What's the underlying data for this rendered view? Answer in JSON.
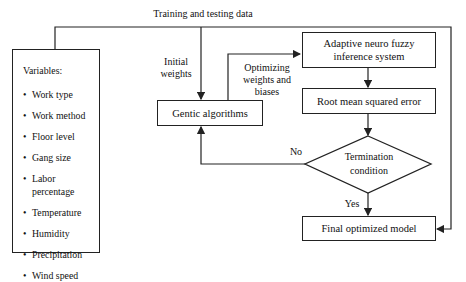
{
  "edges": {
    "training_testing_data": "Training and testing data",
    "initial_weights_line1": "Initial",
    "initial_weights_line2": "weights",
    "optimizing_line1": "Optimizing",
    "optimizing_line2": "weights and biases",
    "no": "No",
    "yes": "Yes"
  },
  "variables": {
    "title": "Variables:",
    "bullet": "•",
    "items": [
      "Work type",
      "Work method",
      "Floor level",
      "Gang size",
      "Labor",
      "percentage",
      "Temperature",
      "Humidity",
      "Precipitation",
      "Wind speed"
    ]
  },
  "nodes": {
    "genetic_algorithms": "Gentic algorithms",
    "anfis_line1": "Adaptive neuro fuzzy",
    "anfis_line2": "inference system",
    "rmse": "Root mean squared error",
    "termination_line1": "Termination",
    "termination_line2": "condition",
    "final_model": "Final optimized model"
  }
}
